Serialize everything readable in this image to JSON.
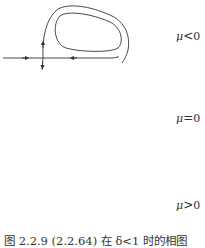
{
  "figure": {
    "caption": "图 2.2.9  (2.2.64) 在 δ<1 时的相图",
    "panels": [
      {
        "label_symbol": "μ",
        "label_relation": "<",
        "label_value": "0",
        "case": "mu-negative"
      },
      {
        "label_symbol": "μ",
        "label_relation": "=",
        "label_value": "0",
        "case": "mu-zero"
      },
      {
        "label_symbol": "μ",
        "label_relation": ">",
        "label_value": "0",
        "case": "mu-positive"
      }
    ],
    "colors": {
      "stroke": "#333333",
      "background": "#ffffff"
    }
  }
}
